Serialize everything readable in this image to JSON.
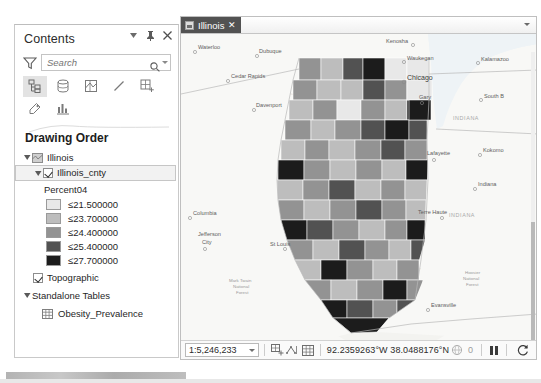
{
  "contents_pane": {
    "title": "Contents",
    "header_buttons": [
      {
        "name": "dropdown-menu-button",
        "glyph": "▾"
      },
      {
        "name": "pin-button",
        "glyph": "⚲"
      },
      {
        "name": "close-button",
        "glyph": "✕"
      }
    ],
    "search": {
      "placeholder": "Search",
      "value": ""
    },
    "toolbar": {
      "row1": [
        {
          "name": "list-by-drawing-order-icon",
          "label": "List By Drawing Order",
          "active": true
        },
        {
          "name": "list-by-data-source-icon",
          "label": "List By Data Source",
          "active": false
        },
        {
          "name": "list-by-selection-icon",
          "label": "List By Selection",
          "active": false
        },
        {
          "name": "list-by-editing-icon",
          "label": "List By Editing",
          "active": false
        },
        {
          "name": "list-by-snapping-icon",
          "label": "List By Snapping",
          "active": false
        }
      ],
      "row2": [
        {
          "name": "list-by-labeling-icon",
          "label": "List By Labeling",
          "active": false
        },
        {
          "name": "list-by-charts-icon",
          "label": "List By Charts",
          "active": false
        }
      ]
    },
    "drawing_order_heading": "Drawing Order",
    "tree": {
      "map_name": "Illinois",
      "layer_name": "Illinois_cnty",
      "layer_checked": true,
      "field_label": "Percent04",
      "basemap_name": "Topographic",
      "basemap_checked": true,
      "standalone_tables_heading": "Standalone Tables",
      "table_name": "Obesity_Prevalence"
    },
    "legend": [
      {
        "label": "≤21.500000",
        "color": "#e8e8e8"
      },
      {
        "label": "≤23.700000",
        "color": "#bdbdbd"
      },
      {
        "label": "≤24.400000",
        "color": "#939393"
      },
      {
        "label": "≤25.400000",
        "color": "#525252"
      },
      {
        "label": "≤27.700000",
        "color": "#1c1c1c"
      }
    ]
  },
  "map_view": {
    "tab": {
      "label": "Illinois",
      "close_glyph": "✕"
    },
    "tabbar_overflow_glyph": "▾",
    "status_bar": {
      "scale": "1:5,246,233",
      "coordinates": "92.2359263°W 38.0488176°N",
      "selection_count": "0",
      "buttons": [
        {
          "name": "select-features-button",
          "label": "Select Features"
        },
        {
          "name": "measure-button",
          "label": "Measure"
        },
        {
          "name": "attribute-table-button",
          "label": "Attribute Table"
        },
        {
          "name": "selection-globe-button",
          "label": "Selection"
        },
        {
          "name": "pause-drawing-button",
          "label": "Pause Drawing"
        },
        {
          "name": "refresh-button",
          "label": "Refresh"
        }
      ]
    },
    "map_labels": {
      "cities": [
        {
          "name": "Waterloo",
          "x": 17,
          "y": 15,
          "big": false
        },
        {
          "name": "Dubuque",
          "x": 78,
          "y": 19,
          "big": false
        },
        {
          "name": "Cedar Rapids",
          "x": 50,
          "y": 44,
          "big": false
        },
        {
          "name": "Davenport",
          "x": 75,
          "y": 73,
          "big": false
        },
        {
          "name": "Kenosha",
          "x": 205,
          "y": 9,
          "big": false
        },
        {
          "name": "Waukegan",
          "x": 226,
          "y": 26,
          "big": false
        },
        {
          "name": "Chicago",
          "x": 226,
          "y": 46,
          "big": true
        },
        {
          "name": "Gary",
          "x": 238,
          "y": 65,
          "big": false
        },
        {
          "name": "Kalamazoo",
          "x": 300,
          "y": 27,
          "big": false
        },
        {
          "name": "South B",
          "x": 303,
          "y": 64,
          "big": false
        },
        {
          "name": "Lafayette",
          "x": 246,
          "y": 121,
          "big": false
        },
        {
          "name": "Kokomo",
          "x": 302,
          "y": 118,
          "big": false
        },
        {
          "name": "Indiana",
          "x": 297,
          "y": 152,
          "big": false
        },
        {
          "name": "Terre Haute",
          "x": 237,
          "y": 180,
          "big": false
        },
        {
          "name": "Columbia",
          "x": 12,
          "y": 181,
          "big": false
        },
        {
          "name": "Jefferson",
          "x": 17,
          "y": 202,
          "big": false
        },
        {
          "name": "City",
          "x": 21,
          "y": 210,
          "big": false
        },
        {
          "name": "St Louis",
          "x": 89,
          "y": 212,
          "big": false
        },
        {
          "name": "Evansville",
          "x": 250,
          "y": 273,
          "big": false
        },
        {
          "name": "Bowling",
          "x": 314,
          "y": 313,
          "big": false
        },
        {
          "name": "Green",
          "x": 315,
          "y": 320,
          "big": false
        }
      ],
      "states": [
        {
          "name": "INDIANA",
          "x": 272,
          "y": 86
        },
        {
          "name": "INDIANA",
          "x": 268,
          "y": 183
        }
      ],
      "forests": [
        {
          "lines": [
            "Mark Twain",
            "National",
            "Forest"
          ],
          "x": 48,
          "y": 248
        },
        {
          "lines": [
            "Hoosier",
            "National",
            "Forest"
          ],
          "x": 282,
          "y": 248
        }
      ]
    },
    "choropleth": {
      "field": "Percent04",
      "classes": [
        "#e8e8e8",
        "#bdbdbd",
        "#939393",
        "#525252",
        "#1c1c1c"
      ],
      "county_classes": [
        2,
        1,
        3,
        4,
        0,
        0,
        2,
        2,
        1,
        3,
        3,
        2,
        0,
        1,
        2,
        3,
        2,
        2,
        1,
        4,
        0,
        3,
        2,
        2,
        1,
        2,
        3,
        2,
        4,
        2,
        1,
        3,
        1,
        2,
        2,
        3,
        1,
        2,
        3,
        2,
        2,
        3,
        4,
        2,
        1,
        2,
        2,
        3,
        1,
        2,
        2,
        1,
        3,
        2,
        2,
        4,
        3,
        2,
        1,
        3,
        2,
        2,
        3,
        1,
        2,
        1,
        3,
        2,
        4,
        2,
        1,
        2,
        3,
        1,
        2,
        2,
        3,
        1,
        2,
        3,
        2,
        3,
        4,
        2,
        1,
        2,
        3,
        2,
        1,
        2,
        2,
        3,
        1,
        4,
        2,
        3,
        3,
        2,
        1,
        2,
        2,
        3,
        4,
        4,
        3,
        2,
        3,
        4,
        2
      ]
    }
  }
}
